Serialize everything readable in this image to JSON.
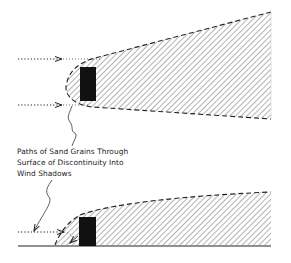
{
  "diagram": {
    "caption_lines": [
      "Paths of Sand Grains Through",
      "Surface of Discontinuity Into",
      "Wind Shadows"
    ],
    "colors": {
      "line": "#222222",
      "hatch": "#555555",
      "obstacle": "#111111",
      "background": "#ffffff"
    },
    "views": [
      {
        "name": "plan-view",
        "description": "Top view: obstacle with wind shadow zone and two incoming grain paths"
      },
      {
        "name": "profile-view",
        "description": "Side view: obstacle on ground with wind shadow and incoming grain path"
      }
    ]
  }
}
